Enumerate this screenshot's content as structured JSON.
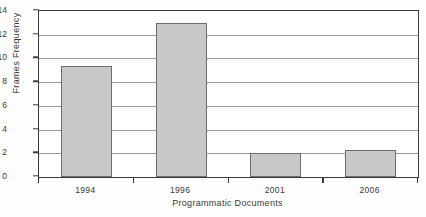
{
  "chart_data": {
    "type": "bar",
    "title": "",
    "categories": [
      "1994",
      "1996",
      "2001",
      "2006"
    ],
    "values": [
      9.4,
      13.0,
      2.0,
      2.3
    ],
    "xlabel": "Programmatic Documents",
    "ylabel": "Frames Frequency",
    "ylim": [
      0,
      14
    ],
    "yticks": [
      0,
      2,
      4,
      6,
      8,
      10,
      12,
      14
    ],
    "ytick_labels": [
      "0",
      "2",
      "4",
      "6",
      "8",
      "10",
      "12",
      "14"
    ],
    "grid": true,
    "grid_axis": "y",
    "legend": false,
    "legend_position": "none",
    "bar_color": "#c8c8c8",
    "bar_edge_color": "#6d6d6d",
    "grid_color": "#9a9a9a",
    "axis_color": "#3b3b3b",
    "background_color": "#ffffff"
  }
}
